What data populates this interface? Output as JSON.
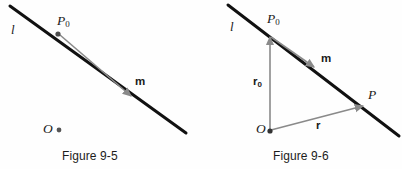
{
  "page": {
    "background_color": "#fefefe",
    "ink_color": "#111111",
    "accent_gray": "#8a8a8a"
  },
  "figures": [
    {
      "id": "figure-9-5",
      "caption": "Figure 9-5",
      "caption_x": 62,
      "caption_y": 149,
      "line": {
        "name": "line-l",
        "label": "l",
        "label_x": 11,
        "label_y": 23,
        "x1": 10,
        "y1": 6,
        "x2": 186,
        "y2": 133,
        "color": "#111111",
        "width": 3
      },
      "points": [
        {
          "name": "point-p0",
          "label": "P",
          "subscript": "0",
          "label_x": 57,
          "label_y": 14,
          "dot_x": 58,
          "dot_y": 34,
          "dot_r": 2.6,
          "dot_color": "#4d4d4d"
        },
        {
          "name": "point-o",
          "label": "O",
          "subscript": "",
          "label_x": 43,
          "label_y": 122,
          "dot_x": 59,
          "dot_y": 130,
          "dot_r": 2.4,
          "dot_color": "#555555"
        }
      ],
      "vectors": [
        {
          "name": "vector-m",
          "label": "m",
          "subscript": "",
          "label_x": 135,
          "label_y": 76,
          "x1": 60,
          "y1": 35,
          "x2": 131,
          "y2": 96,
          "color": "#8a8a8a",
          "width": 1.6
        }
      ]
    },
    {
      "id": "figure-9-6",
      "caption": "Figure 9-6",
      "caption_x": 72,
      "caption_y": 149,
      "line": {
        "name": "line-l",
        "label": "l",
        "label_x": 29,
        "label_y": 20,
        "x1": 27,
        "y1": 5,
        "x2": 198,
        "y2": 136,
        "color": "#111111",
        "width": 3
      },
      "points": [
        {
          "name": "point-p0",
          "label": "P",
          "subscript": "0",
          "label_x": 66,
          "label_y": 12,
          "dot_x": 69,
          "dot_y": 36,
          "dot_r": 0,
          "dot_color": "#4d4d4d"
        },
        {
          "name": "point-p",
          "label": "P",
          "subscript": "",
          "label_x": 167,
          "label_y": 88,
          "dot_x": 0,
          "dot_y": 0,
          "dot_r": 0,
          "dot_color": "#4d4d4d"
        },
        {
          "name": "point-o",
          "label": "O",
          "subscript": "",
          "label_x": 55,
          "label_y": 122,
          "dot_x": 69,
          "dot_y": 131,
          "dot_r": 2.6,
          "dot_color": "#333333"
        }
      ],
      "vectors": [
        {
          "name": "vector-r0",
          "label": "r",
          "subscript": "0",
          "label_x": 52,
          "label_y": 76,
          "x1": 69,
          "y1": 130,
          "x2": 69,
          "y2": 37,
          "color": "#8a8a8a",
          "width": 1.6
        },
        {
          "name": "vector-m",
          "label": "m",
          "subscript": "",
          "label_x": 120,
          "label_y": 53,
          "x1": 70,
          "y1": 37,
          "x2": 113,
          "y2": 67,
          "color": "#8a8a8a",
          "width": 1.6
        },
        {
          "name": "vector-r",
          "label": "r",
          "subscript": "",
          "label_x": 115,
          "label_y": 120,
          "x1": 70,
          "y1": 130,
          "x2": 162,
          "y2": 106,
          "color": "#8a8a8a",
          "width": 1.6
        }
      ]
    }
  ]
}
